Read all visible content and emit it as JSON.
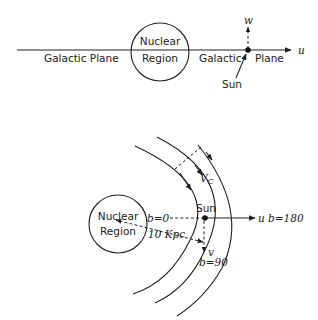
{
  "top_diagram": {
    "left_plane_label": "Galactic  Plane",
    "nucleus_line1": "Nuclear",
    "nucleus_line2": "Region",
    "right_plane_label1": "Galactic",
    "right_plane_label2": "Plane",
    "axis_u": "u",
    "axis_w": "w",
    "sun_label": "Sun"
  },
  "bottom_diagram": {
    "nucleus_line1": "Nuclear",
    "nucleus_line2": "Region",
    "sun_label": "Sun",
    "axis_u": "u",
    "b0_label": "b=0",
    "b180_label": "b=180",
    "b90_label": "b=90",
    "v_label": "v",
    "vc_label": "V",
    "vc_sub": "C",
    "distance_label": "10 Kpc"
  }
}
